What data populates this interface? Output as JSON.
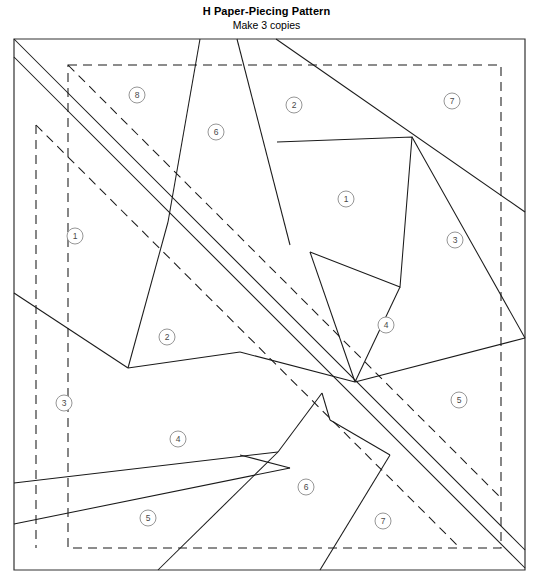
{
  "document": {
    "title": "H Paper-Piecing Pattern",
    "subtitle": "Make 3 copies",
    "page_width": 533,
    "page_height": 581
  },
  "colors": {
    "line": "#1a1a1a",
    "border": "#333333",
    "label_stroke": "#8a8a8a",
    "label_text": "#4a4a4a",
    "background": "#ffffff"
  },
  "pattern": {
    "outer_border": {
      "x1": 14,
      "y1": 39,
      "x2": 525,
      "y2": 570
    },
    "dashed_seam_box": {
      "x1": 68,
      "y1": 65,
      "x2": 501,
      "y2": 548
    },
    "dashed_inner_box": {
      "x1": 36,
      "y1": 125
    },
    "section_labels": [
      {
        "number": "1",
        "x": 75,
        "y": 236
      },
      {
        "number": "2",
        "x": 167,
        "y": 337
      },
      {
        "number": "3",
        "x": 64,
        "y": 403
      },
      {
        "number": "4",
        "x": 178,
        "y": 439
      },
      {
        "number": "5",
        "x": 148,
        "y": 518
      },
      {
        "number": "6",
        "x": 216,
        "y": 132
      },
      {
        "number": "8",
        "x": 137,
        "y": 95
      },
      {
        "number": "2b",
        "x": 294,
        "y": 105
      },
      {
        "number": "7",
        "x": 452,
        "y": 101
      },
      {
        "number": "1b",
        "x": 346,
        "y": 199
      },
      {
        "number": "3b",
        "x": 455,
        "y": 240
      },
      {
        "number": "4b",
        "x": 386,
        "y": 325
      },
      {
        "number": "5b",
        "x": 459,
        "y": 400
      },
      {
        "number": "6b",
        "x": 306,
        "y": 487
      },
      {
        "number": "7b",
        "x": 383,
        "y": 521
      }
    ],
    "label_values": {
      "l1": "1",
      "l2": "2",
      "l3": "3",
      "l4": "4",
      "l5": "5",
      "l6": "6",
      "l7": "7",
      "l8": "8",
      "l9": "2",
      "l10": "7",
      "l11": "1",
      "l12": "3",
      "l13": "4",
      "l14": "5",
      "l15": "6",
      "l16": "7"
    }
  }
}
